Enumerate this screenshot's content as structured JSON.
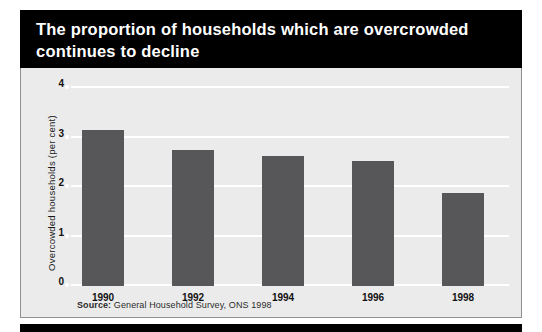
{
  "title": "The proportion of households which are overcrowded\ncontinues to decline",
  "source": {
    "label": "Source:",
    "text": " General Household Survey, ONS 1998"
  },
  "colors": {
    "banner_background": "#000000",
    "banner_text": "#ffffff",
    "panel_background": "#ebebeb",
    "panel_border": "#8f8f8f",
    "bar_fill": "#57575a",
    "gridline": "#ffffff",
    "axis_text": "#111111"
  },
  "chart_data": {
    "type": "bar",
    "title": "The proportion of households which are overcrowded continues to decline",
    "categories": [
      "1990",
      "1992",
      "1994",
      "1996",
      "1998"
    ],
    "values": [
      3.15,
      2.75,
      2.63,
      2.53,
      1.87
    ],
    "xlabel": "",
    "ylabel": "Overcowded households (per cent)",
    "ylim": [
      0,
      4
    ],
    "yticks": [
      "0",
      "1",
      "2",
      "3",
      "4"
    ],
    "ytick_values": [
      0,
      1,
      2,
      3,
      4
    ],
    "grid": true,
    "legend": false,
    "source": "Source: General Household Survey, ONS 1998"
  }
}
